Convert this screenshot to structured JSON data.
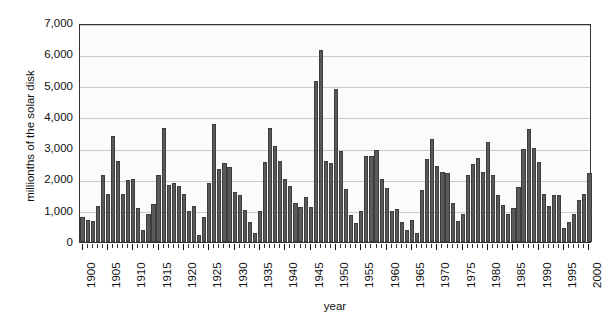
{
  "chart_data": {
    "type": "bar",
    "title": "",
    "subtitle": "",
    "xlabel": "year",
    "ylabel": "millionths of the solar disk",
    "xlim": [
      1899.5,
      2000.5
    ],
    "ylim": [
      0,
      7000
    ],
    "grid": true,
    "legend": null,
    "legend_position": "none",
    "bar_color": "#5a5a5a",
    "bar_edge_color": "#3d3d3d",
    "plot_background": "#fbfbfb",
    "gridline_color": "#c9c9c9",
    "axis_color": "#333333",
    "ytick_labels": [
      "0",
      "1,000",
      "2,000",
      "3,000",
      "4,000",
      "5,000",
      "6,000",
      "7,000"
    ],
    "ytick_values": [
      0,
      1000,
      2000,
      3000,
      4000,
      5000,
      6000,
      7000
    ],
    "xtick_labels": [
      "1900",
      "1905",
      "1910",
      "1915",
      "1920",
      "1925",
      "1930",
      "1935",
      "1940",
      "1945",
      "1950",
      "1955",
      "1960",
      "1965",
      "1970",
      "1975",
      "1980",
      "1985",
      "1990",
      "1995",
      "2000"
    ],
    "xtick_values": [
      1900,
      1905,
      1910,
      1915,
      1920,
      1925,
      1930,
      1935,
      1940,
      1945,
      1950,
      1955,
      1960,
      1965,
      1970,
      1975,
      1980,
      1985,
      1990,
      1995,
      2000
    ],
    "categories": [
      1900,
      1901,
      1902,
      1903,
      1904,
      1905,
      1906,
      1907,
      1908,
      1909,
      1910,
      1911,
      1912,
      1913,
      1914,
      1915,
      1916,
      1917,
      1918,
      1919,
      1920,
      1921,
      1922,
      1923,
      1924,
      1925,
      1926,
      1927,
      1928,
      1929,
      1930,
      1931,
      1932,
      1933,
      1934,
      1935,
      1936,
      1937,
      1938,
      1939,
      1940,
      1941,
      1942,
      1943,
      1944,
      1945,
      1946,
      1947,
      1948,
      1949,
      1950,
      1951,
      1952,
      1953,
      1954,
      1955,
      1956,
      1957,
      1958,
      1959,
      1960,
      1961,
      1962,
      1963,
      1964,
      1965,
      1966,
      1967,
      1968,
      1969,
      1970,
      1971,
      1972,
      1973,
      1974,
      1975,
      1976,
      1977,
      1978,
      1979,
      1980,
      1981,
      1982,
      1983,
      1984,
      1985,
      1986,
      1987,
      1988,
      1989,
      1990,
      1991,
      1992,
      1993,
      1994,
      1995,
      1996,
      1997,
      1998,
      1999,
      2000
    ],
    "values": [
      800,
      700,
      660,
      1150,
      2150,
      1550,
      3400,
      2600,
      1520,
      1970,
      2000,
      1100,
      400,
      900,
      1230,
      2150,
      3650,
      1830,
      1880,
      1800,
      1550,
      1000,
      1150,
      220,
      800,
      1900,
      3780,
      2320,
      2530,
      2400,
      1600,
      1500,
      1010,
      630,
      300,
      1000,
      2550,
      3660,
      3080,
      2600,
      2000,
      1800,
      1250,
      1120,
      1450,
      1120,
      5150,
      6150,
      2600,
      2520,
      4880,
      2900,
      1700,
      850,
      600,
      1000,
      2750,
      2750,
      2950,
      2030,
      1720,
      1000,
      1050,
      650,
      400,
      700,
      300,
      1650,
      2650,
      3280,
      2420,
      2230,
      2220,
      1250,
      680,
      900,
      2150,
      2500,
      2700,
      2250,
      3200,
      2130,
      1500,
      1170,
      900,
      1080,
      1750,
      2970,
      3620,
      3000,
      2550,
      1520,
      1160,
      1500,
      1500,
      450,
      650,
      900,
      1350,
      1550,
      2200
    ]
  }
}
